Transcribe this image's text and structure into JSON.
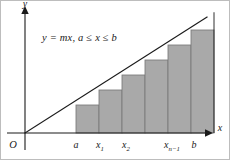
{
  "figure": {
    "equation": {
      "full": "y = mx,  a ≤ x ≤ b",
      "lhs": "y",
      "equals": "=",
      "rhs": "mx",
      "comma": ",",
      "domain": "a ≤ x ≤ b",
      "domain_lower": "a",
      "domain_var": "x",
      "domain_upper": "b",
      "le_symbol": "≤"
    },
    "axes": {
      "x_label": "x",
      "y_label": "y",
      "origin_label": "O",
      "x_arrow": "arrow-right",
      "y_arrow": "arrow-up"
    },
    "tick_labels": [
      {
        "id": "a",
        "base": "a",
        "sub": "",
        "x": 76
      },
      {
        "id": "x1",
        "base": "x",
        "sub": "1",
        "x": 100
      },
      {
        "id": "x2",
        "base": "x",
        "sub": "2",
        "x": 126
      },
      {
        "id": "xn-1",
        "base": "x",
        "sub": "n−1",
        "x": 172
      },
      {
        "id": "b",
        "base": "b",
        "sub": "",
        "x": 194
      }
    ],
    "colors": {
      "bar_fill": "#a9a9a9",
      "bar_stroke": "#7a7a7a",
      "line": "#1a1a1a",
      "axis": "#1a1a1a",
      "frame": "#bdbdbd",
      "background": "#ffffff",
      "text": "#1a1a1a"
    }
  },
  "chart_data": {
    "type": "bar",
    "title": "y = mx,  a ≤ x ≤ b",
    "subtitle": "",
    "xlabel": "x",
    "ylabel": "y",
    "grid": false,
    "legend": null,
    "xlim": [
      0,
      205
    ],
    "ylim": [
      0,
      133
    ],
    "categories": [
      "a",
      "x1",
      "x2",
      "x3",
      "x4",
      "xn-1"
    ],
    "x_tick_labels": [
      "O",
      "a",
      "x₁",
      "x₂",
      "xₙ₋₁",
      "b"
    ],
    "annotations": [
      {
        "text": "y = mx,  a ≤ x ≤ b",
        "x": 42,
        "y": 38
      }
    ],
    "line_series": {
      "name": "y = mx",
      "x": [
        25,
        205
      ],
      "y": [
        133,
        18
      ],
      "slope_note": "passes through origin O"
    },
    "bars": [
      {
        "label": "a",
        "x_left": 76,
        "x_right": 99,
        "top_y": 105,
        "height": 28
      },
      {
        "label": "x1",
        "x_left": 99,
        "x_right": 122,
        "top_y": 90,
        "height": 43
      },
      {
        "label": "x2",
        "x_left": 122,
        "x_right": 145,
        "top_y": 75,
        "height": 58
      },
      {
        "label": "x3",
        "x_left": 145,
        "x_right": 168,
        "top_y": 60,
        "height": 73
      },
      {
        "label": "x4",
        "x_left": 168,
        "x_right": 191,
        "top_y": 45,
        "height": 88
      },
      {
        "label": "xn-1",
        "x_left": 191,
        "x_right": 214,
        "top_y": 30,
        "height": 103
      }
    ],
    "values": [
      28,
      43,
      58,
      73,
      88,
      103
    ],
    "bar_count": 6
  }
}
